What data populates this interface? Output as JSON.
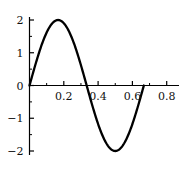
{
  "chart_data": {
    "type": "line",
    "title": "",
    "xlabel": "",
    "ylabel": "",
    "xlim": [
      -0.02,
      0.85
    ],
    "ylim": [
      -2.2,
      2.2
    ],
    "grid": false,
    "legend": null,
    "axis_color": "#000000",
    "curve_color": "#000000",
    "background_color": "#ffffff",
    "x_ticks": [
      0.2,
      0.4,
      0.6,
      0.8
    ],
    "x_tick_labels": [
      "0.2",
      "0.4",
      "0.6",
      "0.8"
    ],
    "x_minor_ticks": [
      0.1,
      0.3,
      0.5,
      0.7
    ],
    "y_ticks": [
      2,
      1,
      0,
      -1,
      -2
    ],
    "y_tick_labels": [
      "2",
      "1",
      "0",
      "−1",
      "−2"
    ],
    "y_minor_ticks": [
      1.5,
      0.5,
      -0.5,
      -1.5
    ],
    "series": [
      {
        "name": "2 sin(3πx)",
        "amplitude": 2,
        "period": 0.6667,
        "x_start": 0,
        "x_end": 0.6667,
        "x": [
          0,
          0.0167,
          0.0333,
          0.05,
          0.0667,
          0.0833,
          0.1,
          0.1167,
          0.1333,
          0.15,
          0.1667,
          0.1833,
          0.2,
          0.2167,
          0.2333,
          0.25,
          0.2667,
          0.2833,
          0.3,
          0.3167,
          0.3333,
          0.35,
          0.3667,
          0.3833,
          0.4,
          0.4167,
          0.4333,
          0.45,
          0.4667,
          0.4833,
          0.5,
          0.5167,
          0.5333,
          0.55,
          0.5667,
          0.5833,
          0.6,
          0.6167,
          0.6333,
          0.65,
          0.6667
        ],
        "y": [
          0,
          0.312,
          0.618,
          0.908,
          1.176,
          1.414,
          1.618,
          1.782,
          1.902,
          1.975,
          2,
          1.975,
          1.902,
          1.782,
          1.618,
          1.414,
          1.176,
          0.908,
          0.618,
          0.312,
          0,
          -0.312,
          -0.618,
          -0.908,
          -1.176,
          -1.414,
          -1.618,
          -1.782,
          -1.902,
          -1.975,
          -2,
          -1.975,
          -1.902,
          -1.782,
          -1.618,
          -1.414,
          -1.176,
          -0.908,
          -0.618,
          -0.312,
          0
        ]
      }
    ],
    "annotations": {
      "peak": {
        "x": 0.1667,
        "y": 2
      },
      "trough": {
        "x": 0.5,
        "y": -2
      },
      "zero_crossings": [
        0,
        0.3333,
        0.6667
      ]
    }
  }
}
